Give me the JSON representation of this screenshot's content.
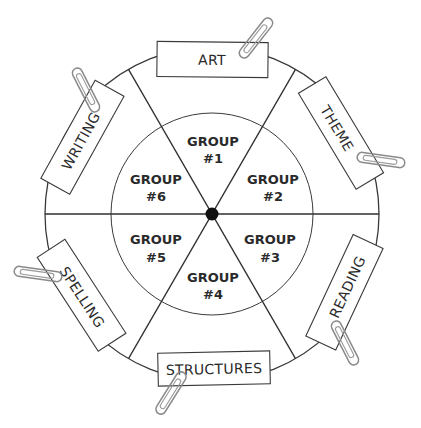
{
  "diagram": {
    "type": "rotation-wheel",
    "center": {
      "x": 212,
      "y": 214
    },
    "outer_radius": 167,
    "inner_radius": 101,
    "line_color": "#3a3a3a",
    "hub_color": "#111111",
    "groups": [
      {
        "line1": "GROUP",
        "line2": "#1"
      },
      {
        "line1": "GROUP",
        "line2": "#2"
      },
      {
        "line1": "GROUP",
        "line2": "#3"
      },
      {
        "line1": "GROUP",
        "line2": "#4"
      },
      {
        "line1": "GROUP",
        "line2": "#5"
      },
      {
        "line1": "GROUP",
        "line2": "#6"
      }
    ],
    "stations": [
      {
        "label": "ART"
      },
      {
        "label": "THEME"
      },
      {
        "label": "READING"
      },
      {
        "label": "STRUCTURES"
      },
      {
        "label": "SPELLING"
      },
      {
        "label": "WRITING"
      }
    ]
  }
}
